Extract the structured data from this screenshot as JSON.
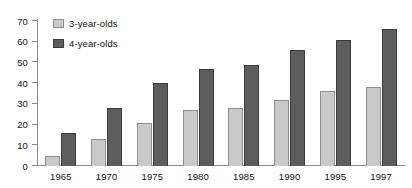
{
  "chart_data": {
    "type": "bar",
    "title": "",
    "subtitle": "",
    "xlabel": "",
    "ylabel": "",
    "categories": [
      "1965",
      "1970",
      "1975",
      "1980",
      "1985",
      "1990",
      "1995",
      "1997"
    ],
    "series": [
      {
        "name": "3-year-olds",
        "color": "#c9c9c9",
        "values": [
          5,
          13,
          21,
          27,
          28,
          32,
          36,
          38
        ]
      },
      {
        "name": "4-year-olds",
        "color": "#5d5d5d",
        "values": [
          16,
          28,
          40,
          47,
          49,
          56,
          61,
          66
        ]
      }
    ],
    "ylim": [
      0,
      70
    ],
    "ytick_step": 10,
    "yticks": [
      "70",
      "60",
      "50",
      "40",
      "30",
      "20",
      "10",
      "0"
    ],
    "grid": false,
    "legend_position": "top-left",
    "legend": [
      "3-year-olds",
      "4-year-olds"
    ]
  },
  "legend": {
    "items": [
      {
        "label": "3-year-olds",
        "swatch": "legend-swatch-light-gray"
      },
      {
        "label": "4-year-olds",
        "swatch": "legend-swatch-dark-gray"
      }
    ]
  },
  "colors": {
    "background": "#ffffff",
    "axis": "#8a8a8a",
    "text": "#111111",
    "series_young_fill": "#c9c9c9",
    "series_young_stroke": "#8f8f8f",
    "series_old_fill": "#5d5d5d",
    "series_old_stroke": "#3b3b3b"
  }
}
